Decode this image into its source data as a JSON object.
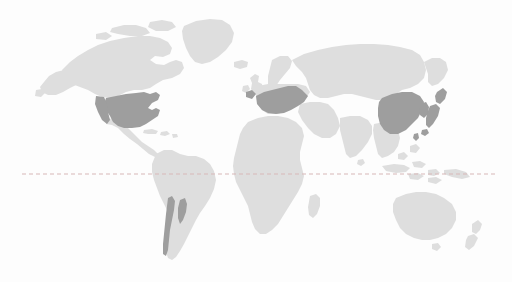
{
  "map": {
    "title": "World map with highlighted regions",
    "projection": "equirectangular",
    "background_color": "#fdfdfd",
    "land_color": "#dedede",
    "highlight_color": "#9e9e9e",
    "equator": {
      "label": "equator",
      "color": "#d8b8b8",
      "style": "dashed",
      "y_position_px": 174,
      "x_start_px": 22,
      "x_end_px": 496
    },
    "regions": [
      {
        "name": "north-america",
        "label": "North America",
        "highlighted": false
      },
      {
        "name": "greenland",
        "label": "Greenland",
        "highlighted": false
      },
      {
        "name": "united-states",
        "label": "United States",
        "highlighted": true
      },
      {
        "name": "central-america",
        "label": "Central America",
        "highlighted": false
      },
      {
        "name": "south-america",
        "label": "South America",
        "highlighted": false
      },
      {
        "name": "chile",
        "label": "Chile",
        "highlighted": true
      },
      {
        "name": "europe",
        "label": "Europe",
        "highlighted": true
      },
      {
        "name": "united-kingdom",
        "label": "United Kingdom",
        "highlighted": false
      },
      {
        "name": "africa",
        "label": "Africa",
        "highlighted": false
      },
      {
        "name": "madagascar",
        "label": "Madagascar",
        "highlighted": false
      },
      {
        "name": "russia",
        "label": "Russia",
        "highlighted": false
      },
      {
        "name": "middle-east",
        "label": "Middle East",
        "highlighted": false
      },
      {
        "name": "india",
        "label": "India",
        "highlighted": false
      },
      {
        "name": "southeast-asia",
        "label": "Southeast Asia",
        "highlighted": false
      },
      {
        "name": "china",
        "label": "China",
        "highlighted": true
      },
      {
        "name": "korea",
        "label": "Korea",
        "highlighted": true
      },
      {
        "name": "japan",
        "label": "Japan",
        "highlighted": true
      },
      {
        "name": "australia",
        "label": "Australia",
        "highlighted": false
      },
      {
        "name": "new-zealand",
        "label": "New Zealand",
        "highlighted": false
      }
    ]
  }
}
